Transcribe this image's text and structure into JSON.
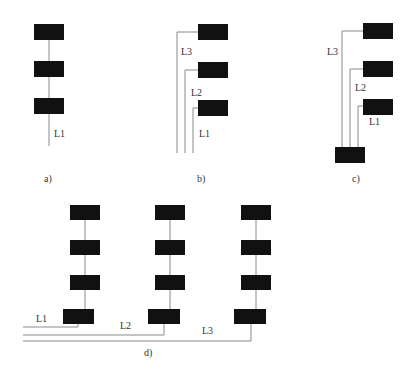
{
  "colors": {
    "box": "#111111",
    "wire": "#8a8a8a",
    "text": "#333333"
  },
  "panels": {
    "a": {
      "caption": "a)",
      "lines": [
        "L1"
      ]
    },
    "b": {
      "caption": "b)",
      "lines": [
        "L1",
        "L2",
        "L3"
      ]
    },
    "c": {
      "caption": "c)",
      "lines": [
        "L1",
        "L2",
        "L3"
      ]
    },
    "d": {
      "caption": "d)",
      "lines": [
        "L1",
        "L2",
        "L3"
      ]
    }
  }
}
